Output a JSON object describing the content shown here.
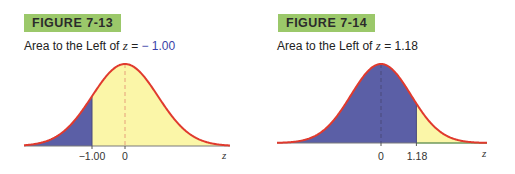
{
  "figures": [
    {
      "badge": "FIGURE 7-13",
      "subtitle_prefix": "Area to the Left of ",
      "subtitle_var": "z",
      "subtitle_eq": " = ",
      "subtitle_value": "− 1.00",
      "tick_labels": [
        "−1.00",
        "0"
      ],
      "axis_label": "z"
    },
    {
      "badge": "FIGURE 7-14",
      "subtitle_prefix": "Area to the Left of ",
      "subtitle_var": "z",
      "subtitle_eq": " = ",
      "subtitle_value": "1.18",
      "tick_labels": [
        "0",
        "1.18"
      ],
      "axis_label": "z"
    }
  ],
  "colors": {
    "badge": "#9bc86a",
    "curve": "#e03a2e",
    "shaded": "#5b5fa6",
    "unshaded": "#fbf6a8",
    "mean_line": "#e6a07a",
    "baseline_green": "#6aa84f"
  },
  "chart_data": [
    {
      "type": "area",
      "title": "FIGURE 7-13: Area to the Left of z = -1.00",
      "distribution": "standard normal",
      "xlabel": "z",
      "shaded_region": {
        "from": "-inf",
        "to": -1.0
      },
      "tick_labels": [
        "-1.00",
        "0"
      ],
      "ticks": [
        -1.0,
        0
      ],
      "mean_line": 0,
      "grid": false
    },
    {
      "type": "area",
      "title": "FIGURE 7-14: Area to the Left of z = 1.18",
      "distribution": "standard normal",
      "xlabel": "z",
      "shaded_region": {
        "from": "-inf",
        "to": 1.18
      },
      "tick_labels": [
        "0",
        "1.18"
      ],
      "ticks": [
        0,
        1.18
      ],
      "mean_line": 0,
      "grid": false
    }
  ]
}
